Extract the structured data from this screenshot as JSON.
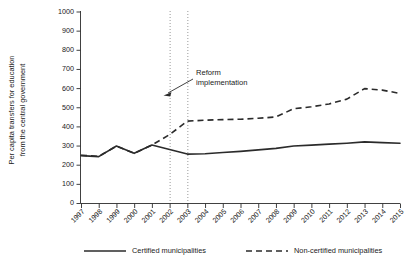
{
  "chart_data": {
    "type": "line",
    "title": "",
    "subtitle": "",
    "xlabel": "",
    "ylabel": "Per capita transfers for education from the central government",
    "ylabel_line1": "Per capita transfers for education",
    "ylabel_line2": "from the central government",
    "grid": false,
    "legend_position": "bottom",
    "xlim": [
      1997,
      2015
    ],
    "ylim": [
      0,
      1000
    ],
    "categories": [
      "1997",
      "1998",
      "1999",
      "2000",
      "2001",
      "2002",
      "2003",
      "2004",
      "2005",
      "2006",
      "2007",
      "2008",
      "2009",
      "2010",
      "2011",
      "2012",
      "2013",
      "2014",
      "2015"
    ],
    "ytick_labels": [
      "0",
      "100",
      "200",
      "300",
      "400",
      "500",
      "600",
      "700",
      "800",
      "900",
      "1000"
    ],
    "ytick_values": [
      0,
      100,
      200,
      300,
      400,
      500,
      600,
      700,
      800,
      900,
      1000
    ],
    "series": [
      {
        "name": "Certified municipalities",
        "style": "solid",
        "color": "#2b2b2b",
        "values": [
          250,
          245,
          300,
          262,
          305,
          282,
          258,
          260,
          266,
          272,
          280,
          288,
          300,
          305,
          310,
          315,
          322,
          318,
          315
        ]
      },
      {
        "name": "Non-certified municipalities",
        "style": "dashed",
        "color": "#2b2b2b",
        "values": [
          252,
          246,
          300,
          262,
          305,
          360,
          430,
          435,
          438,
          440,
          445,
          452,
          495,
          505,
          520,
          545,
          600,
          592,
          575
        ]
      }
    ],
    "annotations": [
      {
        "text_line1": "Reform",
        "text_line2": "implementation",
        "text_x": 2001.6,
        "text_y": 700,
        "arrow_target_x": 2002.0,
        "arrow_target_y": 570
      }
    ],
    "reference_lines": [
      {
        "x": 2002,
        "style": "dotted",
        "color": "#8d8d8d"
      },
      {
        "x": 2003,
        "style": "dotted",
        "color": "#8d8d8d"
      }
    ]
  },
  "legend": {
    "items": [
      {
        "label": "Certified municipalities",
        "style": "solid"
      },
      {
        "label": "Non-certified municipalities",
        "style": "dashed"
      }
    ]
  }
}
